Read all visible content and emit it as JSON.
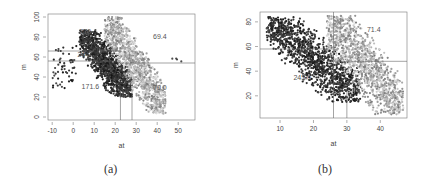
{
  "captions": {
    "a": "(a)",
    "b": "(b)"
  },
  "chart_data": [
    {
      "type": "scatter",
      "panel": "(a)",
      "title": "",
      "xlabel": "at",
      "ylabel": "m",
      "xlim": [
        -12,
        58
      ],
      "ylim": [
        -3,
        103
      ],
      "xticks": [
        -10,
        0,
        10,
        20,
        30,
        40,
        50
      ],
      "yticks": [
        0,
        20,
        40,
        60,
        80,
        100
      ],
      "grid": false,
      "legend": null,
      "reference_lines": {
        "horizontal": [
          66,
          56,
          54
        ],
        "vertical": [
          22.5,
          28
        ]
      },
      "annotations": [
        {
          "text": "270",
          "x": 3,
          "y": 83
        },
        {
          "text": "244",
          "x": 2,
          "y": 60
        },
        {
          "text": "69.4",
          "x": 38,
          "y": 78
        },
        {
          "text": "171.6",
          "x": 4,
          "y": 28
        },
        {
          "text": "70.0",
          "x": 38,
          "y": 27
        }
      ],
      "series": [
        {
          "name": "dark cluster",
          "color": "#222222",
          "x_range": [
            3,
            28
          ],
          "y_range": [
            20,
            87
          ]
        },
        {
          "name": "light cluster",
          "color": "#aaaaaa",
          "x_range": [
            15,
            44
          ],
          "y_range": [
            3,
            100
          ]
        },
        {
          "name": "outliers",
          "color": "#333333",
          "x_range": [
            -10,
            54
          ],
          "y_range": [
            28,
            72
          ]
        }
      ]
    },
    {
      "type": "scatter",
      "panel": "(b)",
      "title": "",
      "xlabel": "at",
      "ylabel": "m",
      "xlim": [
        4,
        48
      ],
      "ylim": [
        2,
        88
      ],
      "xticks": [
        10,
        20,
        30,
        40
      ],
      "yticks": [
        20,
        40,
        60,
        80
      ],
      "grid": false,
      "legend": null,
      "reference_lines": {
        "horizontal": [
          58,
          48
        ],
        "vertical": [
          26,
          30
        ]
      },
      "annotations": [
        {
          "text": "71.4",
          "x": 36,
          "y": 72
        },
        {
          "text": "245.0",
          "x": 14,
          "y": 33
        }
      ],
      "series": [
        {
          "name": "dark cluster",
          "color": "#222222",
          "x_range": [
            6,
            34
          ],
          "y_range": [
            15,
            84
          ]
        },
        {
          "name": "light cluster",
          "color": "#aaaaaa",
          "x_range": [
            24,
            47
          ],
          "y_range": [
            5,
            85
          ]
        }
      ]
    }
  ]
}
